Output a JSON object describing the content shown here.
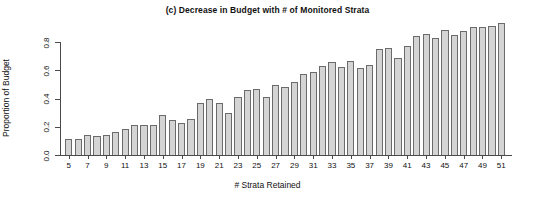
{
  "chart_data": {
    "type": "bar",
    "title": "(c) Decrease in Budget with # of Monitored Strata",
    "xlabel": "# Strata Retained",
    "ylabel": "Proportion of Budget",
    "xlim": [
      4,
      52
    ],
    "ylim": [
      0.0,
      0.95
    ],
    "grid": false,
    "legend": null,
    "bar_color": "#d4d4d4",
    "bar_border_color": "#6b6b6b",
    "axis_color": "#4a4a4a",
    "y_ticks": [
      "0.0",
      "0.2",
      "0.4",
      "0.6",
      "0.8"
    ],
    "y_tick_values": [
      0.0,
      0.2,
      0.4,
      0.6,
      0.8
    ],
    "x_ticks": [
      "5",
      "7",
      "9",
      "11",
      "13",
      "15",
      "17",
      "19",
      "21",
      "23",
      "25",
      "27",
      "29",
      "31",
      "33",
      "35",
      "37",
      "39",
      "41",
      "43",
      "45",
      "47",
      "49",
      "51"
    ],
    "x_tick_values": [
      5,
      7,
      9,
      11,
      13,
      15,
      17,
      19,
      21,
      23,
      25,
      27,
      29,
      31,
      33,
      35,
      37,
      39,
      41,
      43,
      45,
      47,
      49,
      51
    ],
    "categories": [
      5,
      6,
      7,
      8,
      9,
      10,
      11,
      12,
      13,
      14,
      15,
      16,
      17,
      18,
      19,
      20,
      21,
      22,
      23,
      24,
      25,
      26,
      27,
      28,
      29,
      30,
      31,
      32,
      33,
      34,
      35,
      36,
      37,
      38,
      39,
      40,
      41,
      42,
      43,
      44,
      45,
      46,
      47,
      48,
      49,
      50,
      51
    ],
    "values": [
      0.11,
      0.11,
      0.145,
      0.135,
      0.145,
      0.16,
      0.185,
      0.21,
      0.215,
      0.215,
      0.285,
      0.25,
      0.23,
      0.255,
      0.365,
      0.4,
      0.365,
      0.3,
      0.41,
      0.46,
      0.47,
      0.41,
      0.495,
      0.48,
      0.52,
      0.575,
      0.59,
      0.63,
      0.66,
      0.62,
      0.665,
      0.615,
      0.635,
      0.75,
      0.76,
      0.69,
      0.77,
      0.845,
      0.855,
      0.83,
      0.885,
      0.85,
      0.875,
      0.905,
      0.905,
      0.915,
      0.935
    ]
  }
}
